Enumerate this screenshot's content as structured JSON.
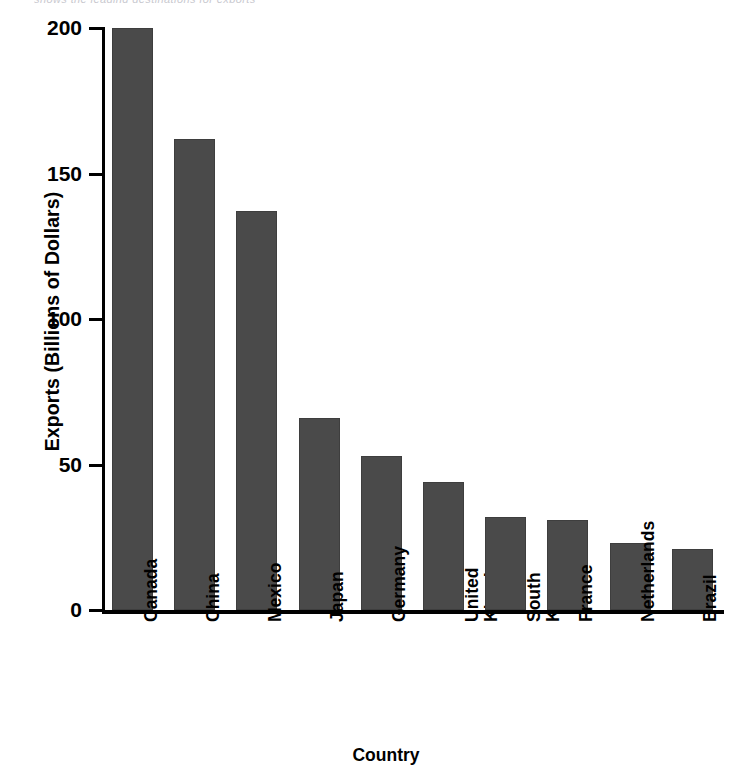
{
  "top_caption_fragment": "shows the leading destinations for exports",
  "chart_data": {
    "type": "bar",
    "title": "",
    "xlabel": "Country",
    "ylabel": "Exports (Billions of Dollars)",
    "categories": [
      "Canada",
      "China",
      "Mexico",
      "Japan",
      "Germany",
      "United Kingdom",
      "South Korea",
      "France",
      "Netherlands",
      "Brazil"
    ],
    "values": [
      200,
      162,
      137,
      66,
      53,
      44,
      32,
      31,
      23,
      21
    ],
    "ylim": [
      0,
      200
    ],
    "yticks": [
      0,
      50,
      100,
      150,
      200
    ],
    "ytick_labels": [
      "0",
      "50",
      "100",
      "150",
      "200"
    ],
    "grid": false,
    "legend": false,
    "bar_color": "#4a4a4a",
    "axis_color": "#000000"
  }
}
